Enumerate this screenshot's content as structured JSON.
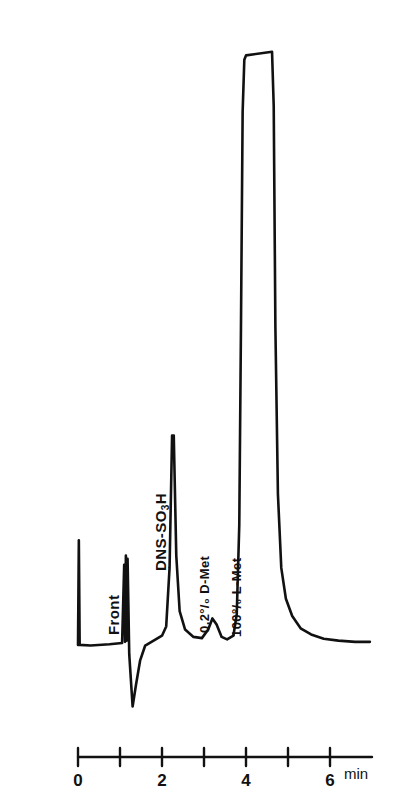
{
  "chart_data": {
    "type": "line",
    "title": "",
    "subtitle": "",
    "xlabel": "min",
    "ylabel": "",
    "xlim": [
      0,
      6.95
    ],
    "ylim": [
      0,
      1.0
    ],
    "grid": false,
    "legend": "none",
    "annotations": [
      {
        "name": "front",
        "label": "Front",
        "x": 1.15,
        "kind": "disturbance"
      },
      {
        "name": "dns-so3h",
        "label": "DNS-SO",
        "label_sub": "3",
        "label_tail": "H",
        "x": 2.25,
        "kind": "peak"
      },
      {
        "name": "d-met",
        "label": "0,2°/₀  D-Met",
        "x": 3.2,
        "kind": "peak"
      },
      {
        "name": "l-met",
        "label": "100°/₀  L-Met",
        "x": 4.0,
        "kind": "peak"
      }
    ],
    "axis": {
      "tick_values": [
        0,
        1,
        2,
        3,
        4,
        5,
        6
      ],
      "tick_labels": [
        "0",
        "",
        "2",
        "",
        "4",
        "",
        "6"
      ],
      "unit": "min"
    },
    "series": [
      {
        "name": "detector-signal",
        "description": "chromatogram trace, baseline with injection spike, solvent front, DNS-SO3H peak, small D-Met peak and saturated off-scale L-Met peak",
        "points": [
          [
            0.0,
            0.005
          ],
          [
            0.02,
            0.175
          ],
          [
            0.04,
            0.005
          ],
          [
            0.3,
            0.004
          ],
          [
            0.75,
            0.006
          ],
          [
            1.05,
            0.008
          ],
          [
            1.1,
            0.135
          ],
          [
            1.12,
            0.01
          ],
          [
            1.14,
            0.15
          ],
          [
            1.16,
            0.012
          ],
          [
            1.18,
            0.145
          ],
          [
            1.22,
            -0.01
          ],
          [
            1.3,
            -0.095
          ],
          [
            1.38,
            -0.06
          ],
          [
            1.48,
            -0.02
          ],
          [
            1.6,
            0.004
          ],
          [
            1.8,
            0.012
          ],
          [
            2.0,
            0.02
          ],
          [
            2.1,
            0.035
          ],
          [
            2.18,
            0.13
          ],
          [
            2.24,
            0.345
          ],
          [
            2.28,
            0.345
          ],
          [
            2.34,
            0.15
          ],
          [
            2.42,
            0.06
          ],
          [
            2.55,
            0.03
          ],
          [
            2.75,
            0.018
          ],
          [
            2.95,
            0.016
          ],
          [
            3.1,
            0.03
          ],
          [
            3.2,
            0.048
          ],
          [
            3.3,
            0.038
          ],
          [
            3.42,
            0.018
          ],
          [
            3.55,
            0.014
          ],
          [
            3.7,
            0.02
          ],
          [
            3.78,
            0.055
          ],
          [
            3.84,
            0.2
          ],
          [
            3.88,
            0.52
          ],
          [
            3.92,
            0.87
          ],
          [
            3.96,
            0.955
          ],
          [
            4.0,
            0.962
          ],
          [
            4.62,
            0.968
          ],
          [
            4.66,
            0.88
          ],
          [
            4.7,
            0.52
          ],
          [
            4.76,
            0.25
          ],
          [
            4.84,
            0.13
          ],
          [
            4.95,
            0.08
          ],
          [
            5.1,
            0.052
          ],
          [
            5.3,
            0.032
          ],
          [
            5.55,
            0.022
          ],
          [
            5.85,
            0.015
          ],
          [
            6.2,
            0.012
          ],
          [
            6.6,
            0.01
          ],
          [
            6.95,
            0.01
          ]
        ]
      }
    ],
    "notes": {
      "saturated_peak": "L-Met peak is flat-topped / off-scale",
      "baseline_level": 0.0
    }
  },
  "style": {
    "trace_color": "#111111",
    "axis_color": "#111111",
    "background": "#ffffff"
  }
}
